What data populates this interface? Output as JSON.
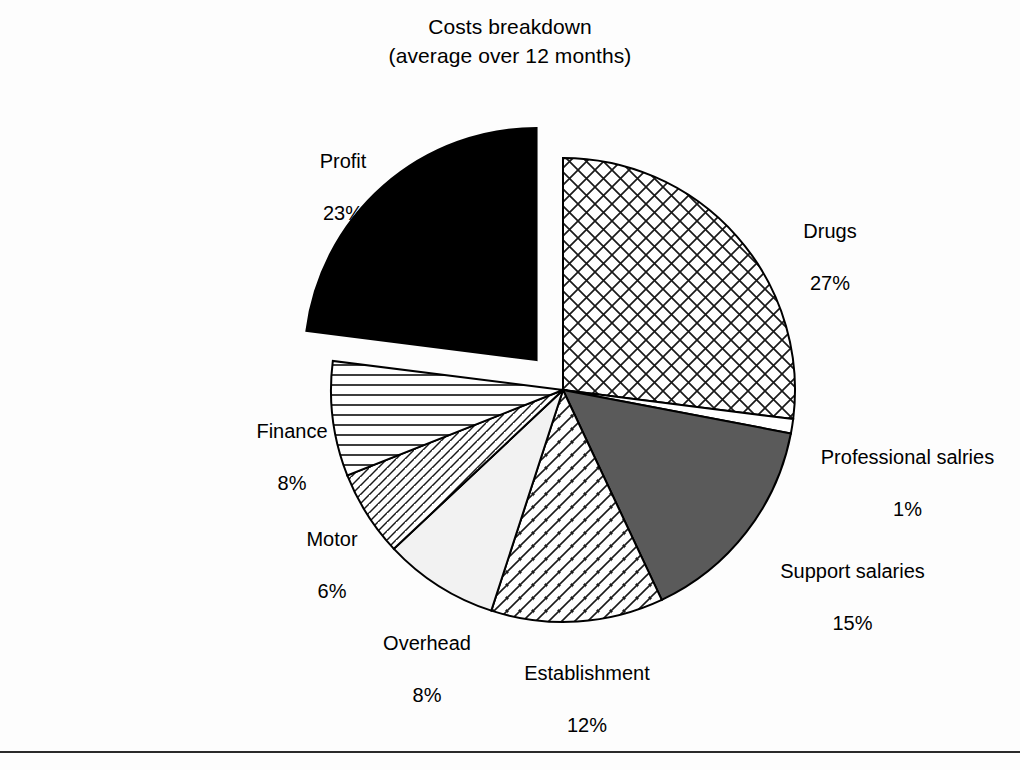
{
  "chart_data": {
    "type": "pie",
    "title_line1": "Costs breakdown",
    "title_line2": "(average over 12 months)",
    "xlabel": "",
    "ylabel": "",
    "legend": "none",
    "grid": false,
    "units": "percent",
    "start_angle_deg": 0,
    "direction": "clockwise",
    "categories": [
      "Drugs",
      "Professional salries",
      "Support salaries",
      "Establishment",
      "Overhead",
      "Motor",
      "Finance",
      "Profit"
    ],
    "values": [
      27,
      1,
      15,
      12,
      8,
      6,
      8,
      23
    ],
    "slices": [
      {
        "key": "drugs",
        "label": "Drugs",
        "value": 27,
        "pct_text": "27%",
        "fill": "crosshatch",
        "fill_color": "#ffffff",
        "stroke": "#000000",
        "exploded": false
      },
      {
        "key": "professional-salaries",
        "label": "Professional salries",
        "value": 1,
        "pct_text": "1%",
        "fill": "solid",
        "fill_color": "#ffffff",
        "stroke": "#000000",
        "exploded": false
      },
      {
        "key": "support-salaries",
        "label": "Support salaries",
        "value": 15,
        "pct_text": "15%",
        "fill": "solid",
        "fill_color": "#5a5a5a",
        "stroke": "#000000",
        "exploded": false
      },
      {
        "key": "establishment",
        "label": "Establishment",
        "value": 12,
        "pct_text": "12%",
        "fill": "diagonal-hatch-right",
        "fill_color": "#ffffff",
        "stroke": "#000000",
        "exploded": false
      },
      {
        "key": "overhead",
        "label": "Overhead",
        "value": 8,
        "pct_text": "8%",
        "fill": "solid",
        "fill_color": "#f2f2f2",
        "stroke": "#000000",
        "exploded": false
      },
      {
        "key": "motor",
        "label": "Motor",
        "value": 6,
        "pct_text": "6%",
        "fill": "diagonal-hatch-dense",
        "fill_color": "#ffffff",
        "stroke": "#000000",
        "exploded": false
      },
      {
        "key": "finance",
        "label": "Finance",
        "value": 8,
        "pct_text": "8%",
        "fill": "horizontal-lines",
        "fill_color": "#ffffff",
        "stroke": "#000000",
        "exploded": false
      },
      {
        "key": "profit",
        "label": "Profit",
        "value": 23,
        "pct_text": "23%",
        "fill": "solid",
        "fill_color": "#000000",
        "stroke": "#000000",
        "exploded": true
      }
    ]
  },
  "colors": {
    "background": "#fdfdfd",
    "ink": "#000000",
    "support_salaries_gray": "#5a5a5a",
    "overhead_light": "#f2f2f2",
    "rule": "#2b2b2b"
  }
}
